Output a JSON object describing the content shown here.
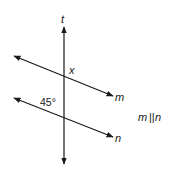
{
  "diagram": {
    "type": "geometry-parallel-lines-transversal",
    "lines": [
      {
        "id": "t",
        "label": "t",
        "role": "transversal"
      },
      {
        "id": "m",
        "label": "m",
        "role": "parallel"
      },
      {
        "id": "n",
        "label": "n",
        "role": "parallel"
      }
    ],
    "angle_labels": {
      "unknown": "x",
      "known": "45°"
    },
    "relation": {
      "left": "m",
      "symbol": "||",
      "right": "n"
    },
    "colors": {
      "stroke": "#1a1a1a",
      "background": "#ffffff"
    }
  }
}
